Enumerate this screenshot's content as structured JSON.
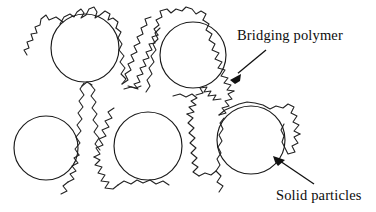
{
  "figure": {
    "background_color": "#ffffff",
    "ink_color": "#111111",
    "width": 376,
    "height": 212
  },
  "labels": {
    "bridging_polymer": "Bridging polymer",
    "solid_particles": "Solid particles"
  },
  "annotations": [
    {
      "name": "bridging-polymer-leader",
      "label": "Bridging polymer",
      "tail_x": 266,
      "tail_y": 50,
      "head_x": 231,
      "head_y": 79
    },
    {
      "name": "solid-particles-leader",
      "label": "Solid particles",
      "tail_x": 314,
      "tail_y": 184,
      "head_x": 274,
      "head_y": 157
    }
  ],
  "chart_data": {
    "type": "diagram",
    "particles": [
      {
        "name": "particle-top-left",
        "cx": 85,
        "cy": 48,
        "r": 34
      },
      {
        "name": "particle-top-right",
        "cx": 193,
        "cy": 55,
        "r": 33
      },
      {
        "name": "particle-bottom-left",
        "cx": 46,
        "cy": 148,
        "r": 32
      },
      {
        "name": "particle-bottom-middle",
        "cx": 148,
        "cy": 146,
        "r": 34
      },
      {
        "name": "particle-bottom-right",
        "cx": 251,
        "cy": 140,
        "r": 34
      }
    ],
    "legend": [
      "Bridging polymer",
      "Solid particles"
    ]
  }
}
